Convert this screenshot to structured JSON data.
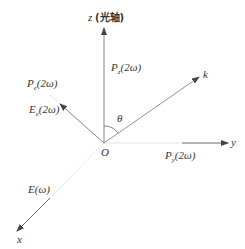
{
  "diagram": {
    "type": "coordinate-axes-vector-diagram",
    "origin_label": "O",
    "axes": {
      "z": {
        "name": "z",
        "annotation": "(光轴)"
      },
      "y": {
        "name": "y"
      },
      "x": {
        "name": "x"
      }
    },
    "wave_vector": {
      "name": "k"
    },
    "angle": {
      "name": "θ"
    },
    "vectors": {
      "pz": {
        "symbol": "P",
        "subscript": "z",
        "arg": "(2ω)"
      },
      "py": {
        "symbol": "P",
        "subscript": "y",
        "arg": "(2ω)"
      },
      "pe": {
        "symbol": "P",
        "subscript": "e",
        "arg": "(2ω)"
      },
      "ee": {
        "symbol": "E",
        "subscript": "e",
        "arg": "(2ω)"
      },
      "e_fund": {
        "symbol": "E",
        "arg": "(ω)"
      }
    },
    "colors": {
      "line": "#555555",
      "faint": "#cccccc",
      "text": "#333333"
    }
  }
}
